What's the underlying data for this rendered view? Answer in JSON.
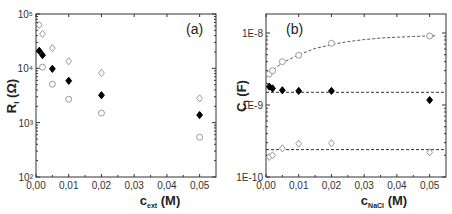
{
  "chart_data": [
    {
      "type": "scatter",
      "panel_label": "(a)",
      "title": "",
      "xlabel": "c",
      "xlabel_sub": "ext",
      "xlabel_unit": "(M)",
      "ylabel": "R",
      "ylabel_sub": "I",
      "ylabel_unit": "(Ω)",
      "xlim": [
        0,
        0.055
      ],
      "ylim": [
        100,
        100000
      ],
      "yscale": "log",
      "x_ticks": [
        "0,00",
        "0,01",
        "0,02",
        "0,03",
        "0,04",
        "0,05"
      ],
      "y_ticks": [
        "10²",
        "10³",
        "10⁴",
        "10⁵"
      ],
      "grid": false,
      "legend": null,
      "series": [
        {
          "name": "open-diamond",
          "marker": "diamond-open",
          "color": "#9a9a9a",
          "x": [
            0.001,
            0.002,
            0.005,
            0.01,
            0.02,
            0.05
          ],
          "y": [
            63000,
            43000,
            23500,
            13500,
            8200,
            2800
          ]
        },
        {
          "name": "filled-diamond",
          "marker": "diamond-filled",
          "color": "#000000",
          "x": [
            0.001,
            0.002,
            0.005,
            0.01,
            0.02,
            0.05
          ],
          "y": [
            21000,
            17500,
            9800,
            5900,
            3200,
            1380
          ]
        },
        {
          "name": "open-circle",
          "marker": "circle-open",
          "color": "#9a9a9a",
          "x": [
            0.002,
            0.005,
            0.01,
            0.02,
            0.05
          ],
          "y": [
            10500,
            5100,
            2700,
            1500,
            540
          ]
        }
      ]
    },
    {
      "type": "scatter",
      "panel_label": "(b)",
      "title": "",
      "xlabel": "c",
      "xlabel_sub": "NaCl",
      "xlabel_unit": "(M)",
      "ylabel": "C",
      "ylabel_sub": "I",
      "ylabel_unit": "(F)",
      "xlim": [
        0,
        0.055
      ],
      "ylim": [
        1e-10,
        2.9e-08
      ],
      "yscale": "log",
      "x_ticks": [
        "0,00",
        "0,01",
        "0,02",
        "0,03",
        "0,04",
        "0,05"
      ],
      "y_ticks": [
        "1E-10",
        "1E-9",
        "1E-8"
      ],
      "grid": false,
      "legend": null,
      "series": [
        {
          "name": "open-circle",
          "marker": "circle-open",
          "color": "#9a9a9a",
          "x": [
            0.001,
            0.002,
            0.005,
            0.01,
            0.02,
            0.05
          ],
          "y": [
            2.7e-09,
            3e-09,
            4e-09,
            4.9e-09,
            7.2e-09,
            9.1e-09
          ]
        },
        {
          "name": "filled-diamond",
          "marker": "diamond-filled",
          "color": "#000000",
          "x": [
            0.001,
            0.002,
            0.005,
            0.01,
            0.02,
            0.05
          ],
          "y": [
            1.8e-09,
            1.7e-09,
            1.6e-09,
            1.57e-09,
            1.57e-09,
            1.17e-09
          ]
        },
        {
          "name": "open-diamond",
          "marker": "diamond-open",
          "color": "#9a9a9a",
          "x": [
            0.001,
            0.002,
            0.005,
            0.01,
            0.02,
            0.05
          ],
          "y": [
            1.9e-10,
            2e-10,
            2.5e-10,
            2.9e-10,
            2.95e-10,
            2.2e-10
          ]
        }
      ],
      "fit_lines": [
        {
          "name": "circle-fit-saturating",
          "style": "dashed",
          "color": "#555555",
          "x": [
            0.0,
            0.002,
            0.005,
            0.01,
            0.015,
            0.02,
            0.025,
            0.03,
            0.035,
            0.04,
            0.045,
            0.05,
            0.052
          ],
          "y": [
            2.5e-09,
            3.05e-09,
            3.85e-09,
            5e-09,
            6.1e-09,
            6.9e-09,
            7.6e-09,
            8.1e-09,
            8.5e-09,
            8.75e-09,
            8.95e-09,
            9.1e-09,
            9.15e-09
          ]
        },
        {
          "name": "filled-level",
          "style": "dashed",
          "color": "#333333",
          "x": [
            0.0,
            0.055
          ],
          "y": [
            1.5e-09,
            1.5e-09
          ]
        },
        {
          "name": "diamond-level",
          "style": "dashed",
          "color": "#333333",
          "x": [
            0.0,
            0.055
          ],
          "y": [
            2.4e-10,
            2.4e-10
          ]
        }
      ]
    }
  ]
}
